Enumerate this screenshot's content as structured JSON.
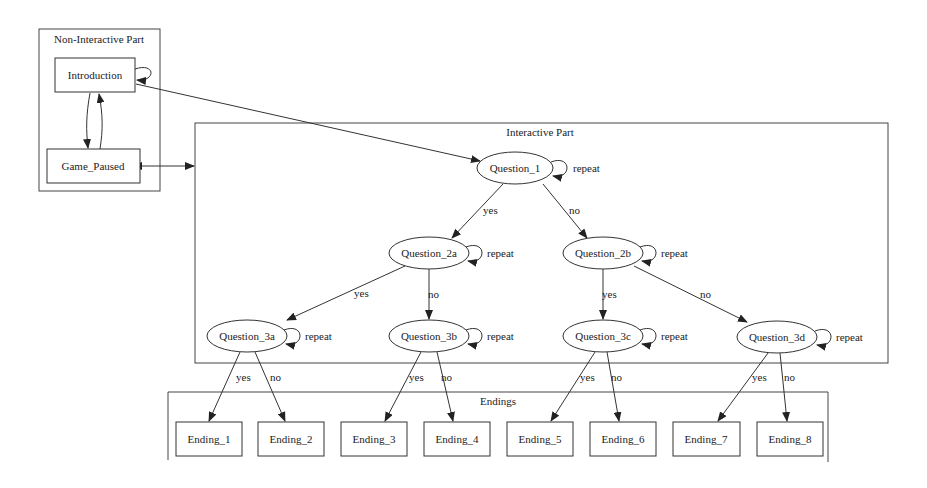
{
  "diagram": {
    "type": "state-flow-graph",
    "colors": {
      "background": "#ffffff",
      "stroke": "#333333",
      "text": "#222222"
    },
    "clusters": {
      "non_interactive": {
        "title": "Non-Interactive Part"
      },
      "interactive": {
        "title": "Interactive Part"
      },
      "endings": {
        "title": "Endings"
      }
    },
    "nodes": {
      "introduction": {
        "label": "Introduction",
        "shape": "box"
      },
      "game_paused": {
        "label": "Game_Paused",
        "shape": "box"
      },
      "q1": {
        "label": "Question_1",
        "shape": "ellipse"
      },
      "q2a": {
        "label": "Question_2a",
        "shape": "ellipse"
      },
      "q2b": {
        "label": "Question_2b",
        "shape": "ellipse"
      },
      "q3a": {
        "label": "Question_3a",
        "shape": "ellipse"
      },
      "q3b": {
        "label": "Question_3b",
        "shape": "ellipse"
      },
      "q3c": {
        "label": "Question_3c",
        "shape": "ellipse"
      },
      "q3d": {
        "label": "Question_3d",
        "shape": "ellipse"
      },
      "e1": {
        "label": "Ending_1",
        "shape": "box"
      },
      "e2": {
        "label": "Ending_2",
        "shape": "box"
      },
      "e3": {
        "label": "Ending_3",
        "shape": "box"
      },
      "e4": {
        "label": "Ending_4",
        "shape": "box"
      },
      "e5": {
        "label": "Ending_5",
        "shape": "box"
      },
      "e6": {
        "label": "Ending_6",
        "shape": "box"
      },
      "e7": {
        "label": "Ending_7",
        "shape": "box"
      },
      "e8": {
        "label": "Ending_8",
        "shape": "box"
      }
    },
    "edge_labels": {
      "repeat": "repeat",
      "yes": "yes",
      "no": "no"
    },
    "edges": [
      {
        "from": "Introduction",
        "to": "Introduction",
        "label": ""
      },
      {
        "from": "Introduction",
        "to": "Game_Paused",
        "label": ""
      },
      {
        "from": "Game_Paused",
        "to": "Introduction",
        "label": ""
      },
      {
        "from": "Game_Paused",
        "to": "Interactive Part",
        "label": "",
        "bidirectional": true
      },
      {
        "from": "Introduction",
        "to": "Question_1",
        "label": ""
      },
      {
        "from": "Question_1",
        "to": "Question_1",
        "label": "repeat"
      },
      {
        "from": "Question_1",
        "to": "Question_2a",
        "label": "yes"
      },
      {
        "from": "Question_1",
        "to": "Question_2b",
        "label": "no"
      },
      {
        "from": "Question_2a",
        "to": "Question_2a",
        "label": "repeat"
      },
      {
        "from": "Question_2b",
        "to": "Question_2b",
        "label": "repeat"
      },
      {
        "from": "Question_2a",
        "to": "Question_3a",
        "label": "yes"
      },
      {
        "from": "Question_2a",
        "to": "Question_3b",
        "label": "no"
      },
      {
        "from": "Question_2b",
        "to": "Question_3c",
        "label": "yes"
      },
      {
        "from": "Question_2b",
        "to": "Question_3d",
        "label": "no"
      },
      {
        "from": "Question_3a",
        "to": "Question_3a",
        "label": "repeat"
      },
      {
        "from": "Question_3b",
        "to": "Question_3b",
        "label": "repeat"
      },
      {
        "from": "Question_3c",
        "to": "Question_3c",
        "label": "repeat"
      },
      {
        "from": "Question_3d",
        "to": "Question_3d",
        "label": "repeat"
      },
      {
        "from": "Question_3a",
        "to": "Ending_1",
        "label": "yes"
      },
      {
        "from": "Question_3a",
        "to": "Ending_2",
        "label": "no"
      },
      {
        "from": "Question_3b",
        "to": "Ending_3",
        "label": "yes"
      },
      {
        "from": "Question_3b",
        "to": "Ending_4",
        "label": "no"
      },
      {
        "from": "Question_3c",
        "to": "Ending_5",
        "label": "yes"
      },
      {
        "from": "Question_3c",
        "to": "Ending_6",
        "label": "no"
      },
      {
        "from": "Question_3d",
        "to": "Ending_7",
        "label": "yes"
      },
      {
        "from": "Question_3d",
        "to": "Ending_8",
        "label": "no"
      }
    ]
  }
}
